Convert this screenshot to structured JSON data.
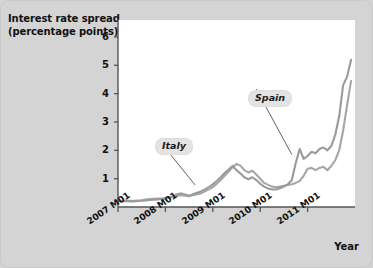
{
  "figure": {
    "title_line1": "Interest rate spread",
    "title_line2": "(percentage points)",
    "xaxis_title": "Year",
    "background_color": "#d4d4d4",
    "plot_background_color": "#ffffff",
    "line_color_italy": "#a6a6a6",
    "line_color_spain": "#9a9a9a",
    "axis_color": "#555555"
  },
  "chart_data": {
    "type": "line",
    "title": "Interest rate spread (percentage points)",
    "xlabel": "Year",
    "ylabel": "Interest rate spread (percentage points)",
    "grid": false,
    "legend_position": "inline-annotation",
    "xlim": [
      0,
      60
    ],
    "ylim": [
      0,
      6.6
    ],
    "yticks": [
      1,
      2,
      3,
      4,
      5,
      6
    ],
    "ytick_labels": [
      "1",
      "2",
      "3",
      "4",
      "5",
      "6"
    ],
    "xticks": [
      0,
      12,
      24,
      36,
      48
    ],
    "xtick_labels": [
      "2007 M01",
      "2008 M01",
      "2009 M01",
      "2010 M01",
      "2011 M01"
    ],
    "x_unit": "months since 2007 M01",
    "annotations": [
      {
        "text": "Italy",
        "label_x": 9.7,
        "label_y": 2.35,
        "points_to_x": 19.5,
        "points_to_y": 0.78
      },
      {
        "text": "Spain",
        "label_x": 33.5,
        "label_y": 4.3,
        "points_to_x": 44.0,
        "points_to_y": 1.85
      }
    ],
    "series": [
      {
        "name": "Italy",
        "color": "#a6a6a6",
        "x": [
          0,
          1,
          2,
          3,
          4,
          5,
          6,
          7,
          8,
          9,
          10,
          11,
          12,
          13,
          14,
          15,
          16,
          17,
          18,
          19,
          20,
          21,
          22,
          23,
          24,
          25,
          26,
          27,
          28,
          29,
          30,
          31,
          32,
          33,
          34,
          35,
          36,
          37,
          38,
          39,
          40,
          41,
          42,
          43,
          44,
          45,
          46,
          47,
          48,
          49,
          50,
          51,
          52,
          53,
          54,
          55,
          56,
          57,
          58,
          59
        ],
        "values": [
          0.22,
          0.22,
          0.23,
          0.22,
          0.22,
          0.23,
          0.24,
          0.26,
          0.28,
          0.29,
          0.3,
          0.3,
          0.31,
          0.33,
          0.36,
          0.4,
          0.42,
          0.4,
          0.38,
          0.42,
          0.45,
          0.48,
          0.55,
          0.62,
          0.7,
          0.82,
          0.95,
          1.1,
          1.25,
          1.4,
          1.52,
          1.46,
          1.3,
          1.22,
          1.28,
          1.15,
          1.0,
          0.85,
          0.78,
          0.72,
          0.7,
          0.72,
          0.75,
          0.78,
          0.8,
          0.85,
          0.92,
          1.1,
          1.35,
          1.38,
          1.3,
          1.38,
          1.42,
          1.3,
          1.45,
          1.65,
          2.0,
          2.7,
          3.6,
          4.45
        ]
      },
      {
        "name": "Spain",
        "color": "#9a9a9a",
        "x": [
          0,
          1,
          2,
          3,
          4,
          5,
          6,
          7,
          8,
          9,
          10,
          11,
          12,
          13,
          14,
          15,
          16,
          17,
          18,
          19,
          20,
          21,
          22,
          23,
          24,
          25,
          26,
          27,
          28,
          29,
          30,
          31,
          32,
          33,
          34,
          35,
          36,
          37,
          38,
          39,
          40,
          41,
          42,
          43,
          44,
          45,
          46,
          47,
          48,
          49,
          50,
          51,
          52,
          53,
          54,
          55,
          56,
          57,
          58,
          59
        ],
        "values": [
          0.2,
          0.2,
          0.21,
          0.2,
          0.2,
          0.21,
          0.22,
          0.23,
          0.25,
          0.26,
          0.27,
          0.28,
          0.3,
          0.33,
          0.38,
          0.45,
          0.48,
          0.44,
          0.4,
          0.45,
          0.5,
          0.55,
          0.62,
          0.7,
          0.8,
          0.92,
          1.05,
          1.2,
          1.32,
          1.45,
          1.3,
          1.18,
          1.05,
          0.98,
          1.05,
          0.95,
          0.82,
          0.72,
          0.65,
          0.62,
          0.62,
          0.66,
          0.72,
          0.8,
          0.95,
          1.55,
          2.05,
          1.7,
          1.8,
          1.95,
          1.9,
          2.05,
          2.1,
          2.0,
          2.15,
          2.55,
          3.2,
          4.3,
          4.6,
          5.2
        ]
      }
    ]
  }
}
